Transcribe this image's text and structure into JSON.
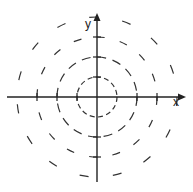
{
  "diagram": {
    "title": "",
    "axes": {
      "x_label": "x",
      "y_label": "y"
    },
    "center": [
      97,
      97
    ],
    "circles": [
      {
        "radius": 20,
        "style": "short-dashed"
      },
      {
        "radius": 40,
        "style": "dashed"
      },
      {
        "radius": 60,
        "style": "long-dashed"
      },
      {
        "radius": 80,
        "style": "sparse-dashed"
      }
    ],
    "ticks": [
      -60,
      -40,
      -20,
      20,
      40,
      60
    ],
    "colors": {
      "stroke": "#222222",
      "background": "#ffffff"
    }
  }
}
